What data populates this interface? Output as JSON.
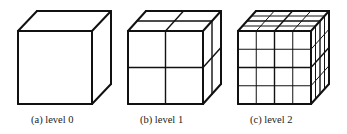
{
  "figure": {
    "panels": [
      {
        "id": "a",
        "caption": "(a) level 0",
        "level": 0,
        "subdivisions": 1
      },
      {
        "id": "b",
        "caption": "(b) level 1",
        "level": 1,
        "subdivisions": 2
      },
      {
        "id": "c",
        "caption": "(c) level 2",
        "level": 2,
        "subdivisions": 4
      }
    ],
    "colors": {
      "line": "#111111",
      "background": "#ffffff"
    }
  }
}
